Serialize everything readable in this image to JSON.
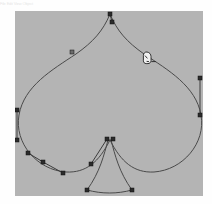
{
  "app": {
    "name": "vector-path-editor",
    "toolbar_labels": [
      "File",
      "Edit",
      "View",
      "Object"
    ],
    "canvas": {
      "x": 15,
      "y": 11,
      "width": 188,
      "height": 185,
      "background_color": "#b4b4b4",
      "page_background_color": "#fefefe"
    }
  },
  "artwork": {
    "name": "spade-shape",
    "stroke_color": "#4a4a4a",
    "stroke_width": 1,
    "fill": "none",
    "path": "M 110 14 C 103 31 93 42 76 54 C 52 70 24 86 19 115 C 14 143 37 170 66 172 C 86 173 99 162 110 140 C 121 162 134 173 154 172 C 183 170 206 143 201 115 C 196 86 168 70 144 54 C 127 42 117 31 110 14 Z",
    "stem_path": "M 108 140 C 104 155 100 172 87 190 C 102 194 117 194 132 190 C 119 172 115 155 111 140 Z"
  },
  "handles": {
    "line_color": "#3c3c3c",
    "anchor_fill": "#2b2b2b",
    "anchor_stroke": "#111111",
    "anchor_size": 4,
    "segments": [
      {
        "name": "top-vertex-handle",
        "x1": 110,
        "y1": 14,
        "x2": 112,
        "y2": 22
      },
      {
        "name": "right-edge-handle",
        "x1": 200,
        "y1": 78,
        "x2": 200,
        "y2": 115
      },
      {
        "name": "left-edge-handle",
        "x1": 17,
        "y1": 110,
        "x2": 17,
        "y2": 140
      },
      {
        "name": "lower-left-handle-a",
        "x1": 28,
        "y1": 153,
        "x2": 43,
        "y2": 162
      },
      {
        "name": "lower-left-handle-b",
        "x1": 43,
        "y1": 162,
        "x2": 63,
        "y2": 173
      },
      {
        "name": "stem-left-handle",
        "x1": 107,
        "y1": 139,
        "x2": 91,
        "y2": 164
      }
    ],
    "anchors": [
      {
        "name": "anchor-top-vertex",
        "x": 110,
        "y": 14,
        "selected": true
      },
      {
        "name": "anchor-top-control",
        "x": 112,
        "y": 22,
        "selected": true
      },
      {
        "name": "anchor-upper-left-curve",
        "x": 72,
        "y": 52,
        "selected": false
      },
      {
        "name": "anchor-right-upper",
        "x": 200,
        "y": 78,
        "selected": true
      },
      {
        "name": "anchor-right-lower",
        "x": 200,
        "y": 115,
        "selected": true
      },
      {
        "name": "anchor-left-upper",
        "x": 17,
        "y": 110,
        "selected": true
      },
      {
        "name": "anchor-left-lower",
        "x": 17,
        "y": 140,
        "selected": true
      },
      {
        "name": "anchor-lower-left-outer",
        "x": 28,
        "y": 153,
        "selected": true
      },
      {
        "name": "anchor-lower-left-mid",
        "x": 43,
        "y": 162,
        "selected": true
      },
      {
        "name": "anchor-lower-left-inner",
        "x": 63,
        "y": 173,
        "selected": true
      },
      {
        "name": "anchor-stem-top-left",
        "x": 107,
        "y": 139,
        "selected": true
      },
      {
        "name": "anchor-stem-top-right",
        "x": 113,
        "y": 139,
        "selected": true
      },
      {
        "name": "anchor-stem-control-left",
        "x": 91,
        "y": 164,
        "selected": true
      },
      {
        "name": "anchor-stem-bottom-left",
        "x": 87,
        "y": 190,
        "selected": true
      },
      {
        "name": "anchor-stem-bottom-right",
        "x": 132,
        "y": 190,
        "selected": true
      }
    ]
  },
  "cursor": {
    "name": "pen-tool-cursor",
    "x": 146,
    "y": 52,
    "color": "#222222"
  }
}
